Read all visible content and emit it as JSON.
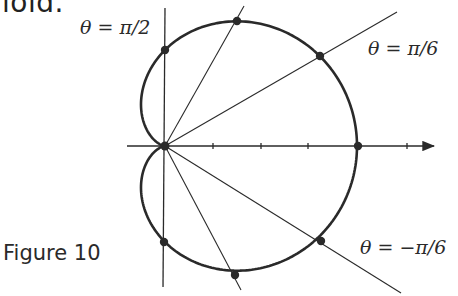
{
  "caption_top": "ioid.",
  "figure_label": "Figure 10",
  "labels": {
    "pi_over_2": "θ = π/2",
    "pi_over_6": "θ = π/6",
    "minus_pi_over_6": "θ = −π/6"
  },
  "colors": {
    "ink": "#2a2a2a",
    "background": "#ffffff"
  },
  "chart_data": {
    "type": "line",
    "equation": "r = 2(1 + cos θ)",
    "coordinate_system": "polar",
    "highlighted_rays_deg": [
      90,
      60,
      30,
      0,
      -30,
      -60,
      -90
    ],
    "labeled_rays": [
      "θ = π/2",
      "θ = π/6",
      "θ = −π/6"
    ],
    "points": [
      {
        "theta": "π/2",
        "r": 2
      },
      {
        "theta": "π/3",
        "r": 3
      },
      {
        "theta": "π/6",
        "r": 3.73
      },
      {
        "theta": "0",
        "r": 4
      },
      {
        "theta": "−π/6",
        "r": 3.73
      },
      {
        "theta": "−π/3",
        "r": 3
      },
      {
        "theta": "−π/2",
        "r": 2
      },
      {
        "theta": "π",
        "r": 0
      }
    ],
    "x_axis_ticks": [
      1,
      2,
      3,
      4,
      5
    ],
    "grid": false
  }
}
